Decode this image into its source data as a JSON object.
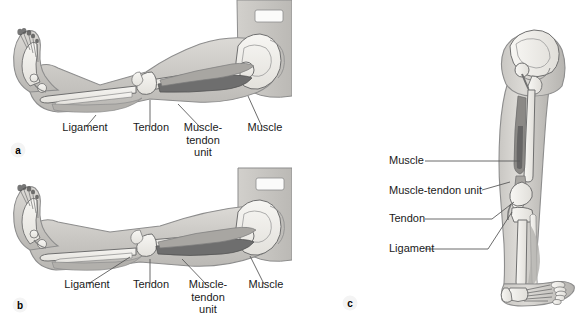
{
  "figure": {
    "type": "anatomical-illustration",
    "background_color": "#ffffff",
    "label_color": "#1a1a1a",
    "leader_line_color": "#5a5a5a",
    "bone_fill": "#f2f0ec",
    "soft_tissue_fill": "#d9d7d3",
    "skin_outline": "#8d8d8d",
    "muscle_dark_fill": "#6e6e6e",
    "muscle_mid_fill": "#a8a6a2"
  },
  "panels": [
    {
      "id": "a",
      "letter": "a",
      "view": "lateral view of flexed lower limb with hip and pelvis",
      "labels": [
        {
          "name": "ligament",
          "text": "Ligament",
          "lines": [
            "Ligament"
          ]
        },
        {
          "name": "tendon",
          "text": "Tendon",
          "lines": [
            "Tendon"
          ]
        },
        {
          "name": "muscle-tendon-unit",
          "text": "Muscle-tendon unit",
          "lines": [
            "Muscle-",
            "tendon",
            "unit"
          ]
        },
        {
          "name": "muscle",
          "text": "Muscle",
          "lines": [
            "Muscle"
          ]
        }
      ]
    },
    {
      "id": "b",
      "letter": "b",
      "view": "lateral view of extended lower limb with hip and pelvis",
      "labels": [
        {
          "name": "ligament",
          "text": "Ligament",
          "lines": [
            "Ligament"
          ]
        },
        {
          "name": "tendon",
          "text": "Tendon",
          "lines": [
            "Tendon"
          ]
        },
        {
          "name": "muscle-tendon-unit",
          "text": "Muscle-tendon unit",
          "lines": [
            "Muscle-",
            "tendon",
            "unit"
          ]
        },
        {
          "name": "muscle",
          "text": "Muscle",
          "lines": [
            "Muscle"
          ]
        }
      ]
    },
    {
      "id": "c",
      "letter": "c",
      "view": "anterior view of standing lower limb",
      "labels": [
        {
          "name": "muscle",
          "text": "Muscle"
        },
        {
          "name": "muscle-tendon-unit",
          "text": "Muscle-tendon unit"
        },
        {
          "name": "tendon",
          "text": "Tendon"
        },
        {
          "name": "ligament",
          "text": "Ligament"
        }
      ]
    }
  ]
}
